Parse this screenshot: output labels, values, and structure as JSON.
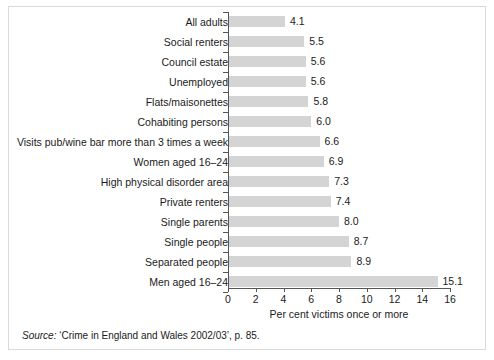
{
  "chart_data": {
    "type": "bar",
    "orientation": "horizontal",
    "title": "",
    "xlabel": "Per cent victims once or more",
    "ylabel": "",
    "xlim": [
      0,
      16
    ],
    "xticks": [
      0,
      2,
      4,
      6,
      8,
      10,
      12,
      14,
      16
    ],
    "grid": false,
    "legend": null,
    "bar_color": "#d4d4d4",
    "axis_color": "#555555",
    "categories": [
      "All adults",
      "Social renters",
      "Council estate",
      "Unemployed",
      "Flats/maisonettes",
      "Cohabiting persons",
      "Visits pub/wine bar more than 3 times a week",
      "Women aged 16–24",
      "High physical disorder area",
      "Private renters",
      "Single parents",
      "Single people",
      "Separated people",
      "Men aged 16–24"
    ],
    "values": [
      4.1,
      5.5,
      5.6,
      5.6,
      5.8,
      6.0,
      6.6,
      6.9,
      7.3,
      7.4,
      8.0,
      8.7,
      8.9,
      15.1
    ],
    "value_labels": [
      "4.1",
      "5.5",
      "5.6",
      "5.6",
      "5.8",
      "6.0",
      "6.6",
      "6.9",
      "7.3",
      "7.4",
      "8.0",
      "8.7",
      "8.9",
      "15.1"
    ]
  },
  "source_note": {
    "prefix": "Source:",
    "text": " ‘Crime in England and Wales 2002/03’, p. 85."
  }
}
